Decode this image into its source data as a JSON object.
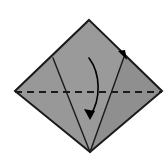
{
  "figure": {
    "canvas": {
      "width": 168,
      "height": 163,
      "background": "#ffffff"
    }
  },
  "colors": {
    "paper_fill": "#9a9a9a",
    "paper_fill_shaded": "#8e8e8e",
    "outline": "#1a1a1a",
    "crease_dashed": "#1a1a1a",
    "arrow": "#000000",
    "highlight_white": "#ffffff",
    "background": "#ffffff"
  },
  "shapes": {
    "main_body": {
      "name": "kite-body",
      "points": "89,20 162,91 90,152 15,91",
      "fill": "#9a9a9a"
    },
    "left_wing": {
      "name": "left-wing-facet",
      "points": "89,20 53,58 15,91",
      "fill": "#949494"
    },
    "right_flap": {
      "name": "right-flap-facet",
      "points": "91,21 162,91 124,57",
      "fill": "#8e8e8e"
    },
    "lower_left_facet": {
      "name": "lower-left-facet",
      "points": "53,58 90,152 15,91",
      "fill": "#989898"
    },
    "lower_right_facet": {
      "name": "lower-right-facet",
      "points": "124,57 162,91 90,152",
      "fill": "#8f8f8f"
    }
  },
  "lines": {
    "outline_path": "M89,20 L162,91 L90,152 L15,91 Z",
    "left_crease": {
      "name": "left-crease-line",
      "x1": 53,
      "y1": 58,
      "x2": 90,
      "y2": 152
    },
    "right_crease": {
      "name": "right-crease-line",
      "x1": 124,
      "y1": 57,
      "x2": 90,
      "y2": 152
    },
    "white_highlight": {
      "name": "flap-highlight-line",
      "x1": 90,
      "y1": 21,
      "x2": 126,
      "y2": 56
    },
    "valley_fold": {
      "name": "valley-fold-dashed-line",
      "x1": 15,
      "y1": 92,
      "x2": 162,
      "y2": 92,
      "dash_pattern": "7 5",
      "stroke_width": 2.2
    }
  },
  "arrows": {
    "fold_down": {
      "name": "fold-down-arrow",
      "path": "M89,58 C101,74 101,100 90,116",
      "head_points": "90,120 84,109 95,111",
      "stroke_width": 1.6,
      "direction": "downward"
    },
    "edge_marker": {
      "name": "edge-direction-arrowhead",
      "head_points": "127,60 118,51 125,50",
      "direction": "down-right"
    }
  },
  "labels": {
    "step_number": "",
    "caption": ""
  }
}
